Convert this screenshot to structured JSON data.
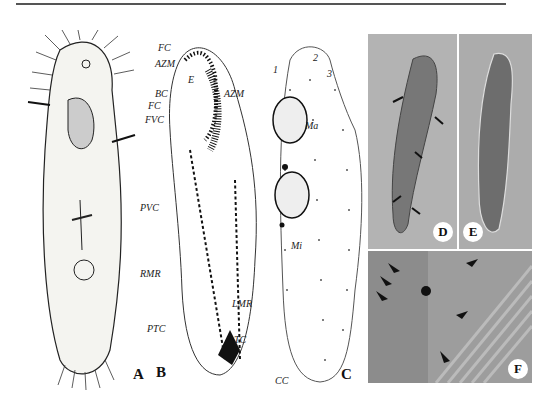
{
  "figure": {
    "panels": [
      {
        "id": "A",
        "label": "A",
        "type": "drawing",
        "description": "ciliate ventral view drawing"
      },
      {
        "id": "B",
        "label": "B",
        "type": "infraciliature-ventral",
        "annotations": [
          "FC",
          "AZM",
          "E",
          "BC",
          "FC",
          "FVC",
          "AZM",
          "PVC",
          "RMR",
          "LMR",
          "PTC",
          "TC"
        ]
      },
      {
        "id": "C",
        "label": "C",
        "type": "infraciliature-dorsal",
        "annotations": [
          "1",
          "2",
          "3",
          "Ma",
          "Mi",
          "CC"
        ]
      },
      {
        "id": "D",
        "label": "D",
        "type": "photomicrograph"
      },
      {
        "id": "E",
        "label": "E",
        "type": "photomicrograph"
      },
      {
        "id": "F",
        "label": "F",
        "type": "photomicrograph"
      }
    ],
    "colors": {
      "ink": "#111111",
      "photo_bg": "#a9a9a9",
      "line": "#555555"
    }
  }
}
